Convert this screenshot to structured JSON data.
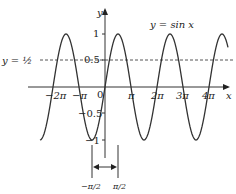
{
  "title": "y = sin x",
  "axes": {
    "x_label": "x",
    "y_label": "y",
    "origin_label": "0"
  },
  "y_ticks": [
    {
      "label": "1",
      "value": 1
    },
    {
      "label": "0.5",
      "value": 0.5
    },
    {
      "label": "−0.5",
      "value": -0.5
    },
    {
      "label": "−1",
      "value": -1
    }
  ],
  "x_ticks": [
    {
      "label": "−2π",
      "value": "-2pi"
    },
    {
      "label": "−π",
      "value": "-pi"
    },
    {
      "label": "π",
      "value": "pi"
    },
    {
      "label": "2π",
      "value": "2pi"
    },
    {
      "label": "3π",
      "value": "3pi"
    },
    {
      "label": "4π",
      "value": "4pi"
    }
  ],
  "reference_line": {
    "label": "y = ½",
    "value": 0.5,
    "style": "dashed"
  },
  "interval": {
    "left_label": "−π/2",
    "right_label": "π/2"
  },
  "colors": {
    "curve": "#333333",
    "axis": "#333333",
    "dashed": "#555555"
  }
}
